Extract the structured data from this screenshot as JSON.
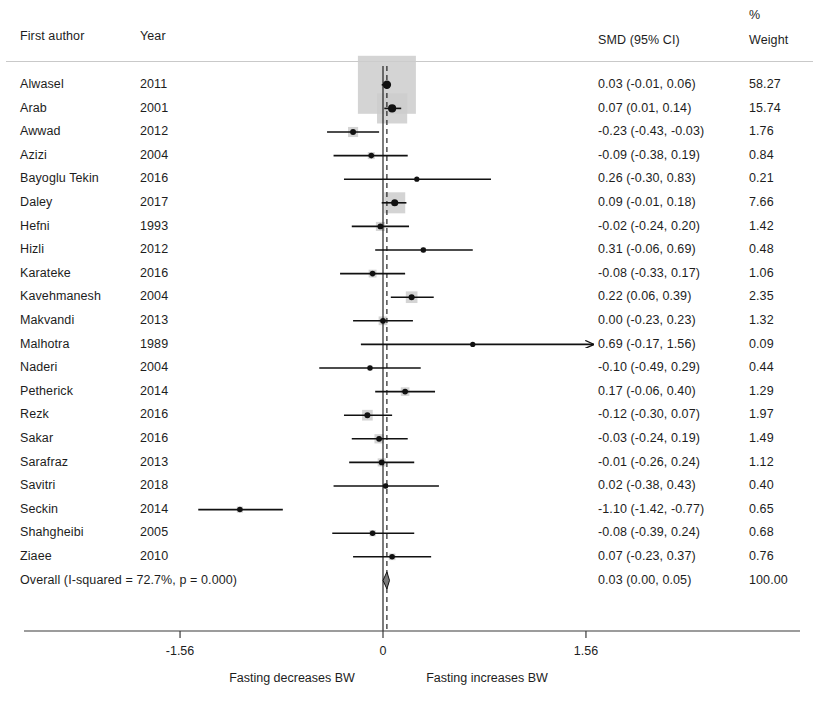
{
  "header": {
    "author": "First author",
    "year": "Year",
    "smd": "SMD (95% CI)",
    "pct": "%",
    "weight": "Weight"
  },
  "overall": {
    "label": "Overall  (I-squared = 72.7%, p = 0.000)",
    "smd_text": "0.03 (0.00, 0.05)",
    "weight_text": "100.00",
    "estimate": 0.03,
    "ci_low": 0.0,
    "ci_high": 0.05,
    "weight": 100.0
  },
  "axis": {
    "ticks": [
      {
        "label": "-1.56",
        "value": -1.56
      },
      {
        "label": "0",
        "value": 0
      },
      {
        "label": "1.56",
        "value": 1.56
      }
    ],
    "left_label": "Fasting decreases BW",
    "right_label": "Fasting increases BW",
    "x_min": -1.56,
    "x_max": 1.56
  },
  "style": {
    "marker_color": "#111111",
    "box_color": "#cccccc",
    "line_color": "#111111",
    "rule_color": "#c9c9c9",
    "axis_color": "#3a3a3a"
  },
  "chart_data": {
    "type": "forest",
    "title": "",
    "xlabel": "SMD (95% CI)",
    "ylabel": "",
    "xlim": [
      -1.56,
      1.56
    ],
    "grid": false,
    "legend": "none",
    "columns": [
      "First author",
      "Year",
      "SMD (95% CI)",
      "% Weight"
    ],
    "effect_measure": "SMD",
    "null_value": 0,
    "heterogeneity": {
      "i_squared_pct": 72.7,
      "p_value": "0.000"
    },
    "studies": [
      {
        "author": "Alwasel",
        "year": "2011",
        "smd_text": "0.03 (-0.01, 0.06)",
        "weight_text": "58.27",
        "estimate": 0.03,
        "ci_low": -0.01,
        "ci_high": 0.06,
        "weight": 58.27,
        "truncated_right": false
      },
      {
        "author": "Arab",
        "year": "2001",
        "smd_text": "0.07 (0.01, 0.14)",
        "weight_text": "15.74",
        "estimate": 0.07,
        "ci_low": 0.01,
        "ci_high": 0.14,
        "weight": 15.74,
        "truncated_right": false
      },
      {
        "author": "Awwad",
        "year": "2012",
        "smd_text": "-0.23 (-0.43, -0.03)",
        "weight_text": "1.76",
        "estimate": -0.23,
        "ci_low": -0.43,
        "ci_high": -0.03,
        "weight": 1.76,
        "truncated_right": false
      },
      {
        "author": "Azizi",
        "year": "2004",
        "smd_text": "-0.09 (-0.38, 0.19)",
        "weight_text": "0.84",
        "estimate": -0.09,
        "ci_low": -0.38,
        "ci_high": 0.19,
        "weight": 0.84,
        "truncated_right": false
      },
      {
        "author": "Bayoglu Tekin",
        "year": "2016",
        "smd_text": "0.26 (-0.30, 0.83)",
        "weight_text": "0.21",
        "estimate": 0.26,
        "ci_low": -0.3,
        "ci_high": 0.83,
        "weight": 0.21,
        "truncated_right": false
      },
      {
        "author": "Daley",
        "year": "2017",
        "smd_text": "0.09 (-0.01, 0.18)",
        "weight_text": "7.66",
        "estimate": 0.09,
        "ci_low": -0.01,
        "ci_high": 0.18,
        "weight": 7.66,
        "truncated_right": false
      },
      {
        "author": "Hefni",
        "year": "1993",
        "smd_text": "-0.02 (-0.24, 0.20)",
        "weight_text": "1.42",
        "estimate": -0.02,
        "ci_low": -0.24,
        "ci_high": 0.2,
        "weight": 1.42,
        "truncated_right": false
      },
      {
        "author": "Hizli",
        "year": "2012",
        "smd_text": "0.31 (-0.06, 0.69)",
        "weight_text": "0.48",
        "estimate": 0.31,
        "ci_low": -0.06,
        "ci_high": 0.69,
        "weight": 0.48,
        "truncated_right": false
      },
      {
        "author": "Karateke",
        "year": "2016",
        "smd_text": "-0.08 (-0.33, 0.17)",
        "weight_text": "1.06",
        "estimate": -0.08,
        "ci_low": -0.33,
        "ci_high": 0.17,
        "weight": 1.06,
        "truncated_right": false
      },
      {
        "author": "Kavehmanesh",
        "year": "2004",
        "smd_text": "0.22 (0.06, 0.39)",
        "weight_text": "2.35",
        "estimate": 0.22,
        "ci_low": 0.06,
        "ci_high": 0.39,
        "weight": 2.35,
        "truncated_right": false
      },
      {
        "author": "Makvandi",
        "year": "2013",
        "smd_text": "0.00 (-0.23, 0.23)",
        "weight_text": "1.32",
        "estimate": 0.0,
        "ci_low": -0.23,
        "ci_high": 0.23,
        "weight": 1.32,
        "truncated_right": false
      },
      {
        "author": "Malhotra",
        "year": "1989",
        "smd_text": "0.69 (-0.17, 1.56)",
        "weight_text": "0.09",
        "estimate": 0.69,
        "ci_low": -0.17,
        "ci_high": 1.56,
        "weight": 0.09,
        "truncated_right": true
      },
      {
        "author": "Naderi",
        "year": "2004",
        "smd_text": "-0.10 (-0.49, 0.29)",
        "weight_text": "0.44",
        "estimate": -0.1,
        "ci_low": -0.49,
        "ci_high": 0.29,
        "weight": 0.44,
        "truncated_right": false
      },
      {
        "author": "Petherick",
        "year": "2014",
        "smd_text": "0.17 (-0.06, 0.40)",
        "weight_text": "1.29",
        "estimate": 0.17,
        "ci_low": -0.06,
        "ci_high": 0.4,
        "weight": 1.29,
        "truncated_right": false
      },
      {
        "author": "Rezk",
        "year": "2016",
        "smd_text": "-0.12 (-0.30, 0.07)",
        "weight_text": "1.97",
        "estimate": -0.12,
        "ci_low": -0.3,
        "ci_high": 0.07,
        "weight": 1.97,
        "truncated_right": false
      },
      {
        "author": "Sakar",
        "year": "2016",
        "smd_text": "-0.03 (-0.24, 0.19)",
        "weight_text": "1.49",
        "estimate": -0.03,
        "ci_low": -0.24,
        "ci_high": 0.19,
        "weight": 1.49,
        "truncated_right": false
      },
      {
        "author": "Sarafraz",
        "year": "2013",
        "smd_text": "-0.01 (-0.26, 0.24)",
        "weight_text": "1.12",
        "estimate": -0.01,
        "ci_low": -0.26,
        "ci_high": 0.24,
        "weight": 1.12,
        "truncated_right": false
      },
      {
        "author": "Savitri",
        "year": "2018",
        "smd_text": "0.02 (-0.38, 0.43)",
        "weight_text": "0.40",
        "estimate": 0.02,
        "ci_low": -0.38,
        "ci_high": 0.43,
        "weight": 0.4,
        "truncated_right": false
      },
      {
        "author": "Seckin",
        "year": "2014",
        "smd_text": "-1.10 (-1.42, -0.77)",
        "weight_text": "0.65",
        "estimate": -1.1,
        "ci_low": -1.42,
        "ci_high": -0.77,
        "weight": 0.65,
        "truncated_right": false
      },
      {
        "author": "Shahgheibi",
        "year": "2005",
        "smd_text": "-0.08 (-0.39, 0.24)",
        "weight_text": "0.68",
        "estimate": -0.08,
        "ci_low": -0.39,
        "ci_high": 0.24,
        "weight": 0.68,
        "truncated_right": false
      },
      {
        "author": "Ziaee",
        "year": "2010",
        "smd_text": "0.07 (-0.23, 0.37)",
        "weight_text": "0.76",
        "estimate": 0.07,
        "ci_low": -0.23,
        "ci_high": 0.37,
        "weight": 0.76,
        "truncated_right": false
      }
    ]
  }
}
